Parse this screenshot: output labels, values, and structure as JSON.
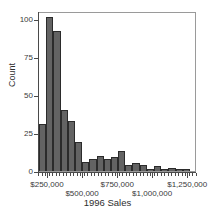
{
  "chart_data": {
    "type": "bar",
    "title": "",
    "xlabel": "1996 Sales",
    "ylabel": "Count",
    "ylim": [
      0,
      105
    ],
    "xlim": [
      187500,
      1312500
    ],
    "grid": false,
    "legend": null,
    "bin_width": 50000,
    "y_ticks": [
      0,
      25,
      50,
      75,
      100
    ],
    "y_tick_labels": [
      "0",
      "25",
      "50",
      "75",
      "100"
    ],
    "x_ticks": [
      250000,
      500000,
      750000,
      1000000,
      1250000
    ],
    "x_tick_labels": [
      "$250,000",
      "$500,000",
      "$750,000",
      "$1,000,000",
      "$1,250,000"
    ],
    "bar_color": "#636363",
    "bar_edge_color": "#2b2b2b",
    "categories": [
      "200,000",
      "250,000",
      "300,000",
      "350,000",
      "400,000",
      "450,000",
      "500,000",
      "550,000",
      "600,000",
      "650,000",
      "700,000",
      "750,000",
      "800,000",
      "850,000",
      "900,000",
      "950,000",
      "1,000,000",
      "1,050,000",
      "1,100,000",
      "1,150,000",
      "1,200,000",
      "1,250,000"
    ],
    "values": [
      31,
      101,
      92,
      40,
      33,
      19,
      6,
      8,
      10,
      8,
      9,
      13,
      4,
      5,
      4,
      1,
      3,
      1,
      2,
      1,
      1,
      0
    ]
  },
  "axes": {
    "y_title": "Count",
    "x_title": "1996 Sales"
  }
}
